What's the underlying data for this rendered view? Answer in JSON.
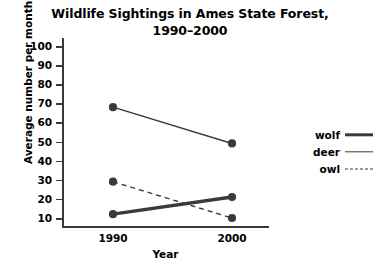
{
  "chart_data": {
    "type": "line",
    "title": "Wildlife Sightings in Ames State Forest, 1990–2000",
    "title_line1": "Wildlife Sightings in Ames State Forest,",
    "title_line2": "1990–2000",
    "xlabel": "Year",
    "ylabel": "Average number per month",
    "categories": [
      "1990",
      "2000"
    ],
    "x": [
      1990,
      2000
    ],
    "ylim": [
      0,
      100
    ],
    "yticks": [
      100,
      90,
      80,
      70,
      60,
      50,
      40,
      30,
      20,
      10
    ],
    "grid": false,
    "legend_position": "right",
    "series": [
      {
        "name": "wolf",
        "values": [
          12,
          21
        ],
        "style": "solid-thick",
        "color": "#3a3a3a"
      },
      {
        "name": "deer",
        "values": [
          68,
          49
        ],
        "style": "solid-thin",
        "color": "#3a3a3a"
      },
      {
        "name": "owl",
        "values": [
          29,
          10
        ],
        "style": "dashed",
        "color": "#3a3a3a"
      }
    ]
  },
  "legend": {
    "items": [
      {
        "label": "wolf",
        "style": "solid-thick"
      },
      {
        "label": "deer",
        "style": "solid-thin"
      },
      {
        "label": "owl",
        "style": "dashed"
      }
    ]
  },
  "colors": {
    "ink": "#3a3a3a",
    "text": "#000000",
    "background": "#ffffff"
  }
}
